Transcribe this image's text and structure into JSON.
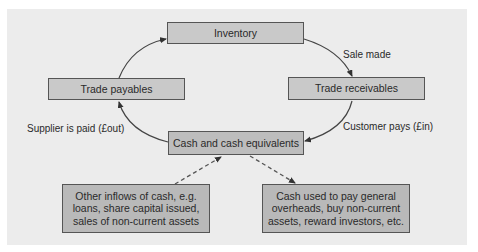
{
  "diagram": {
    "nodes": {
      "inventory": "Inventory",
      "trade_payables": "Trade payables",
      "trade_receivables": "Trade receivables",
      "cash": "Cash and cash equivalents",
      "other_inflows": "Other inflows of cash, e.g. loans, share capital issued, sales of non-current assets",
      "cash_used": "Cash used to pay general overheads, buy non-current assets, reward investors, etc."
    },
    "edge_labels": {
      "sale_made": "Sale made",
      "customer_pays": "Customer pays (£in)",
      "supplier_paid": "Supplier is paid (£out)"
    },
    "edges": [
      {
        "from": "inventory",
        "to": "trade_receivables",
        "label": "Sale made",
        "style": "solid"
      },
      {
        "from": "trade_receivables",
        "to": "cash",
        "label": "Customer pays (£in)",
        "style": "solid"
      },
      {
        "from": "cash",
        "to": "trade_payables",
        "label": "Supplier is paid (£out)",
        "style": "solid"
      },
      {
        "from": "trade_payables",
        "to": "inventory",
        "label": "",
        "style": "solid"
      },
      {
        "from": "other_inflows",
        "to": "cash",
        "label": "",
        "style": "dashed"
      },
      {
        "from": "cash",
        "to": "cash_used",
        "label": "",
        "style": "dashed"
      }
    ],
    "colors": {
      "panel": "#ececec",
      "box": "#c9c9c9",
      "box_dark": "#b9b9b9",
      "stroke": "#444444"
    }
  }
}
